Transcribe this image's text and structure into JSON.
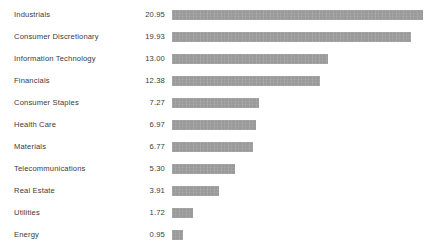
{
  "chart_data": {
    "type": "bar",
    "orientation": "horizontal",
    "title": "",
    "subtitle": "",
    "xlabel": "",
    "ylabel": "",
    "grid": false,
    "legend": null,
    "axis_visible": false,
    "bar_color": "#9a9a9a",
    "text_color": "#3a3a3a",
    "background_color": "#ffffff",
    "value_format": "2-decimal",
    "x_start_px": 172,
    "px_per_unit": 11.98,
    "xlim": [
      0,
      20.95
    ],
    "categories": [
      "Industrials",
      "Consumer Discretionary",
      "Information Technology",
      "Financials",
      "Consumer Staples",
      "Health Care",
      "Materials",
      "Telecommunications",
      "Real Estate",
      "Utilities",
      "Energy"
    ],
    "values": [
      20.95,
      19.93,
      13.0,
      12.38,
      7.27,
      6.97,
      6.77,
      5.3,
      3.91,
      1.72,
      0.95
    ],
    "value_labels": [
      "20.95",
      "19.93",
      "13.00",
      "12.38",
      "7.27",
      "6.97",
      "6.77",
      "5.30",
      "3.91",
      "1.72",
      "0.95"
    ],
    "rows": [
      {
        "label": "Industrials",
        "value": 20.95,
        "value_label": "20.95"
      },
      {
        "label": "Consumer Discretionary",
        "value": 19.93,
        "value_label": "19.93"
      },
      {
        "label": "Information Technology",
        "value": 13.0,
        "value_label": "13.00"
      },
      {
        "label": "Financials",
        "value": 12.38,
        "value_label": "12.38"
      },
      {
        "label": "Consumer Staples",
        "value": 7.27,
        "value_label": "7.27"
      },
      {
        "label": "Health Care",
        "value": 6.97,
        "value_label": "6.97"
      },
      {
        "label": "Materials",
        "value": 6.77,
        "value_label": "6.77"
      },
      {
        "label": "Telecommunications",
        "value": 5.3,
        "value_label": "5.30"
      },
      {
        "label": "Real Estate",
        "value": 3.91,
        "value_label": "3.91"
      },
      {
        "label": "Utilities",
        "value": 1.72,
        "value_label": "1.72"
      },
      {
        "label": "Energy",
        "value": 0.95,
        "value_label": "0.95"
      }
    ]
  },
  "layout": {
    "first_row_top": 4,
    "row_pitch": 22
  }
}
